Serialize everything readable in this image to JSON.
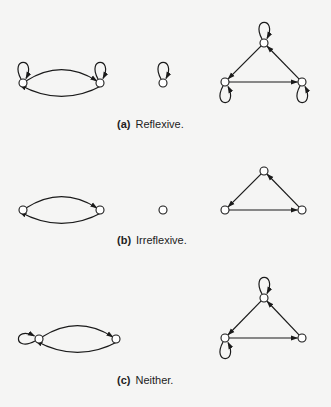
{
  "colors": {
    "background": "#f5f5f4",
    "stroke": "#1a1a1a",
    "node_fill": "#ffffff"
  },
  "panels": [
    {
      "id": "a",
      "caption_tag": "(a)",
      "caption_text": "Reflexive.",
      "caption_pos": {
        "x": 117,
        "y": 118
      },
      "nodes": [
        {
          "id": "a1",
          "x": 23,
          "y": 83,
          "loop": "up"
        },
        {
          "id": "a2",
          "x": 100,
          "y": 83,
          "loop": "up"
        },
        {
          "id": "a3",
          "x": 163,
          "y": 83,
          "loop": "up"
        },
        {
          "id": "a4",
          "x": 264,
          "y": 43,
          "loop": "up"
        },
        {
          "id": "a5",
          "x": 225,
          "y": 82,
          "loop": "down"
        },
        {
          "id": "a6",
          "x": 302,
          "y": 82,
          "loop": "down"
        }
      ],
      "edges": [
        {
          "from": "a1",
          "to": "a2",
          "curve": "upper"
        },
        {
          "from": "a2",
          "to": "a1",
          "curve": "lower"
        },
        {
          "from": "a4",
          "to": "a5",
          "curve": "straight"
        },
        {
          "from": "a5",
          "to": "a6",
          "curve": "straight"
        },
        {
          "from": "a6",
          "to": "a4",
          "curve": "straight"
        }
      ]
    },
    {
      "id": "b",
      "caption_tag": "(b)",
      "caption_text": "Irreflexive.",
      "caption_pos": {
        "x": 117,
        "y": 234
      },
      "nodes": [
        {
          "id": "b1",
          "x": 23,
          "y": 210,
          "loop": "none"
        },
        {
          "id": "b2",
          "x": 100,
          "y": 210,
          "loop": "none"
        },
        {
          "id": "b3",
          "x": 163,
          "y": 210,
          "loop": "none"
        },
        {
          "id": "b4",
          "x": 264,
          "y": 171,
          "loop": "none"
        },
        {
          "id": "b5",
          "x": 225,
          "y": 210,
          "loop": "none"
        },
        {
          "id": "b6",
          "x": 302,
          "y": 210,
          "loop": "none"
        }
      ],
      "edges": [
        {
          "from": "b1",
          "to": "b2",
          "curve": "upper"
        },
        {
          "from": "b2",
          "to": "b1",
          "curve": "lower"
        },
        {
          "from": "b4",
          "to": "b5",
          "curve": "straight"
        },
        {
          "from": "b5",
          "to": "b6",
          "curve": "straight"
        },
        {
          "from": "b6",
          "to": "b4",
          "curve": "straight"
        }
      ]
    },
    {
      "id": "c",
      "caption_tag": "(c)",
      "caption_text": "Neither.",
      "caption_pos": {
        "x": 117,
        "y": 374
      },
      "nodes": [
        {
          "id": "c1",
          "x": 39,
          "y": 339,
          "loop": "left"
        },
        {
          "id": "c2",
          "x": 116,
          "y": 339,
          "loop": "none"
        },
        {
          "id": "c3",
          "x": 264,
          "y": 298,
          "loop": "up"
        },
        {
          "id": "c4",
          "x": 225,
          "y": 338,
          "loop": "down"
        },
        {
          "id": "c5",
          "x": 302,
          "y": 338,
          "loop": "none"
        }
      ],
      "edges": [
        {
          "from": "c1",
          "to": "c2",
          "curve": "upper"
        },
        {
          "from": "c2",
          "to": "c1",
          "curve": "lower"
        },
        {
          "from": "c3",
          "to": "c4",
          "curve": "straight"
        },
        {
          "from": "c4",
          "to": "c5",
          "curve": "straight"
        },
        {
          "from": "c5",
          "to": "c3",
          "curve": "straight"
        }
      ]
    }
  ]
}
